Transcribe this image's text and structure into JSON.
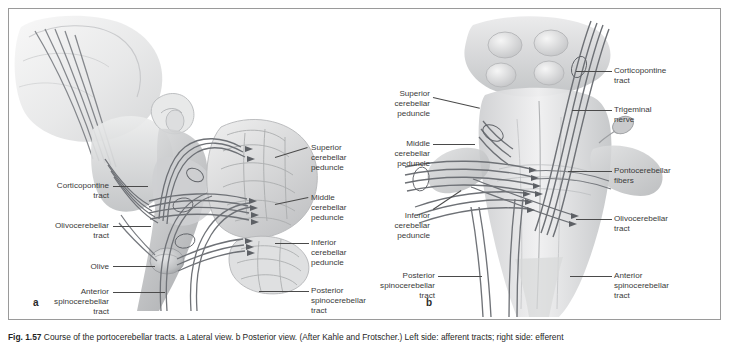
{
  "figure": {
    "panel_a_letter": "a",
    "panel_b_letter": "b",
    "caption_prefix": "Fig. 1.57",
    "caption_text": "  Course of the portocerebellar tracts. a Lateral view. b Posterior view. (After Kahle and Frotscher.) Left side: afferent tracts; right side: efferent"
  },
  "panel_a": {
    "view_name": "lateral-view",
    "labels_left": [
      {
        "id": "corticopontine-tract",
        "text": "Corticopontine\ntract"
      },
      {
        "id": "olivocerebellar-tract",
        "text": "Olivocerebellar\ntract"
      },
      {
        "id": "olive",
        "text": "Olive"
      },
      {
        "id": "anterior-spinocerebellar-tract",
        "text": "Anterior\nspinocerebellar\ntract"
      }
    ],
    "labels_right": [
      {
        "id": "superior-cerebellar-peduncle",
        "text": "Superior\ncerebellar\npeduncle"
      },
      {
        "id": "middle-cerebellar-peduncle",
        "text": "Middle\ncerebellar\npeduncle"
      },
      {
        "id": "inferior-cerebellar-peduncle",
        "text": "Inferior\ncerebellar\npeduncle"
      },
      {
        "id": "posterior-spinocerebellar-tract",
        "text": "Posterior\nspinocerebellar\ntract"
      }
    ]
  },
  "panel_b": {
    "view_name": "posterior-view",
    "labels_left": [
      {
        "id": "superior-cerebellar-peduncle",
        "text": "Superior\ncerebellar\npeduncle"
      },
      {
        "id": "middle-cerebellar-peduncle",
        "text": "Middle\ncerebellar\npeduncle"
      },
      {
        "id": "inferior-cerebellar-peduncle",
        "text": "Inferior\ncerebellar\npeduncle"
      },
      {
        "id": "posterior-spinocerebellar-tract",
        "text": "Posterior\nspinocerebellar\ntract"
      }
    ],
    "labels_right": [
      {
        "id": "corticopontine-tract",
        "text": "Corticopontine\ntract"
      },
      {
        "id": "trigeminal-nerve",
        "text": "Trigeminal\nnerve"
      },
      {
        "id": "pontocerebellar-fibers",
        "text": "Pontocerebellar\nfibers"
      },
      {
        "id": "olivocerebellar-tract",
        "text": "Olivocerebellar\ntract"
      },
      {
        "id": "anterior-spinocerebellar-tract",
        "text": "Anterior\nspinocerebellar\ntract"
      }
    ]
  },
  "colors": {
    "frame": "#9a9a9a",
    "label_text": "#3a3a3a",
    "leader_line": "#4a4a4a",
    "tract_dark": "#6e7176",
    "tract_mid": "#9a9da2",
    "tissue_light": "#e3e3e4",
    "tissue_mid": "#c9cacb",
    "tissue_dark": "#a6a8aa"
  }
}
